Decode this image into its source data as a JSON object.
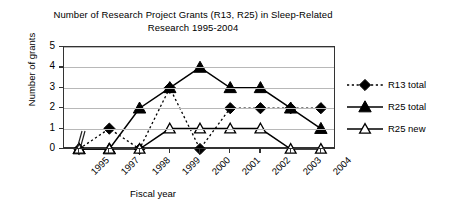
{
  "chart_data": {
    "type": "line",
    "title": "Number of Research Project Grants (R13, R25) in Sleep-Related Research 1995-2004",
    "xlabel": "Fiscal year",
    "ylabel": "Number of grants",
    "categories": [
      "1995",
      "1997",
      "1998",
      "1999",
      "2000",
      "2001",
      "2002",
      "2003",
      "2004"
    ],
    "ylim": [
      0,
      5
    ],
    "yticks": [
      0,
      1,
      2,
      3,
      4,
      5
    ],
    "grid": "horizontal",
    "legend_position": "right",
    "x_axis_break_between": [
      "1995",
      "1997"
    ],
    "series": [
      {
        "name": "R13 total",
        "values": [
          0,
          1,
          0,
          3,
          0,
          2,
          2,
          2,
          2
        ],
        "marker": "filled-diamond",
        "linestyle": "dotted",
        "color": "#000000"
      },
      {
        "name": "R25 total",
        "values": [
          0,
          0,
          2,
          3,
          4,
          3,
          3,
          2,
          1
        ],
        "marker": "filled-triangle",
        "linestyle": "solid",
        "color": "#000000"
      },
      {
        "name": "R25 new",
        "values": [
          0,
          0,
          0,
          1,
          1,
          1,
          1,
          0,
          0
        ],
        "marker": "open-triangle",
        "linestyle": "solid",
        "color": "#000000"
      }
    ]
  }
}
